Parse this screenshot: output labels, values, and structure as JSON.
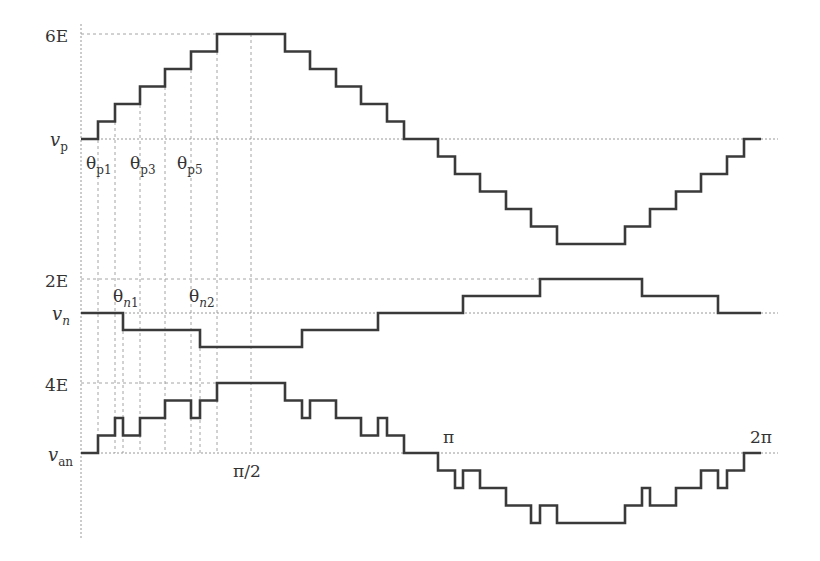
{
  "chart_data": {
    "type": "line",
    "title": "",
    "x_tick_labels": [
      "π/2",
      "π",
      "2π"
    ],
    "angle_labels": [
      "θp1",
      "θp3",
      "θp5",
      "θn1",
      "θn2"
    ],
    "series": [
      {
        "name": "v_p",
        "label_main": "v",
        "label_sub": "p",
        "max_label": "6E",
        "levels": 6,
        "step_x": [
          81,
          98,
          115,
          140,
          165,
          191,
          217,
          285,
          310,
          336,
          361,
          387,
          404,
          438,
          455,
          480,
          506,
          531,
          557,
          625,
          650,
          676,
          701,
          727,
          744,
          761
        ],
        "values": [
          0,
          1,
          2,
          3,
          4,
          5,
          6,
          5,
          4,
          3,
          2,
          1,
          0,
          -1,
          -2,
          -3,
          -4,
          -5,
          -6,
          -5,
          -4,
          -3,
          -2,
          -1,
          0,
          0
        ]
      },
      {
        "name": "v_n",
        "label_main": "v",
        "label_sub": "n",
        "max_label": "2E",
        "levels": 2,
        "step_x": [
          81,
          123,
          200,
          302,
          378,
          463,
          540,
          642,
          718,
          761
        ],
        "values": [
          0,
          -1,
          -2,
          -1,
          0,
          1,
          2,
          1,
          0,
          0
        ]
      },
      {
        "name": "v_an",
        "label_main": "v",
        "label_sub": "an",
        "max_label": "4E",
        "levels": 4,
        "step_x": [
          81,
          98,
          115,
          123,
          140,
          165,
          191,
          200,
          217,
          285,
          302,
          310,
          336,
          361,
          378,
          387,
          404,
          438,
          455,
          463,
          480,
          506,
          531,
          540,
          557,
          625,
          642,
          650,
          676,
          701,
          718,
          727,
          744,
          761
        ],
        "values": [
          0,
          1,
          2,
          1,
          2,
          3,
          2,
          3,
          4,
          3,
          2,
          3,
          2,
          1,
          2,
          1,
          0,
          -1,
          -2,
          -1,
          -2,
          -3,
          -4,
          -3,
          -4,
          -3,
          -2,
          -3,
          -2,
          -1,
          -2,
          -1,
          0,
          0
        ]
      }
    ],
    "xlabel": "θ",
    "xlim": [
      "0",
      "2π"
    ],
    "grid": "dashed vertical guides at switching angles",
    "legend": "none"
  },
  "labels": {
    "vp_max": "6E",
    "vp_main": "v",
    "vp_sub": "p",
    "theta": "θ",
    "tp1_sub": "p1",
    "tp3_sub": "p3",
    "tp5_sub": "p5",
    "vn_max": "2E",
    "vn_main": "v",
    "vn_sub": "n",
    "tn1_sub_n": "n",
    "tn1_sub_num": "1",
    "tn2_sub_n": "n",
    "tn2_sub_num": "2",
    "van_max": "4E",
    "van_main": "v",
    "van_sub": "an",
    "pi_half": "π/2",
    "pi": "π",
    "two_pi": "2π"
  }
}
